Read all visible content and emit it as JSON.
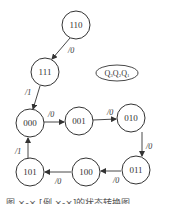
{
  "diagram": {
    "type": "state-transition",
    "legend": {
      "label": "Q3Q2Q1",
      "parts": [
        "Q",
        "3",
        "Q",
        "2",
        "Q",
        "1"
      ]
    },
    "nodes": [
      {
        "id": "110",
        "label": "110",
        "cx": 76,
        "cy": 25
      },
      {
        "id": "111",
        "label": "111",
        "cx": 45,
        "cy": 72
      },
      {
        "id": "000",
        "label": "000",
        "cx": 30,
        "cy": 123
      },
      {
        "id": "001",
        "label": "001",
        "cx": 79,
        "cy": 121
      },
      {
        "id": "010",
        "label": "010",
        "cx": 131,
        "cy": 118
      },
      {
        "id": "011",
        "label": "011",
        "cx": 136,
        "cy": 170
      },
      {
        "id": "100",
        "label": "100",
        "cx": 86,
        "cy": 172
      },
      {
        "id": "101",
        "label": "101",
        "cx": 30,
        "cy": 172
      }
    ],
    "edges": [
      {
        "from": "110",
        "to": "111",
        "label": "/0"
      },
      {
        "from": "111",
        "to": "000",
        "label": "/1"
      },
      {
        "from": "000",
        "to": "001",
        "label": "/0"
      },
      {
        "from": "001",
        "to": "010",
        "label": "/0"
      },
      {
        "from": "010",
        "to": "011",
        "label": "/0"
      },
      {
        "from": "011",
        "to": "100",
        "label": "/0"
      },
      {
        "from": "100",
        "to": "101",
        "label": "/0"
      },
      {
        "from": "101",
        "to": "000",
        "label": "/1"
      }
    ],
    "caption": "图 ×-×  [例 ×-×]的状态转换图"
  }
}
